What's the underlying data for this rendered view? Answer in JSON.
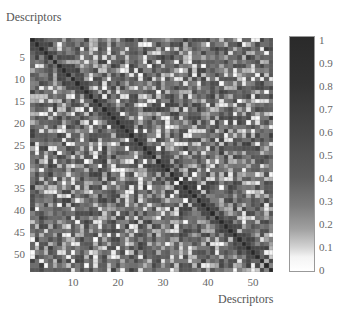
{
  "chart_data": {
    "type": "heatmap",
    "title": "Descriptors",
    "xlabel": "Descriptors",
    "ylabel": "Descriptors",
    "rows": 54,
    "cols": 54,
    "x_ticks": [
      10,
      20,
      30,
      40,
      50
    ],
    "y_ticks": [
      5,
      10,
      15,
      20,
      25,
      30,
      35,
      40,
      45,
      50
    ],
    "colorbar": {
      "ticks": [
        "0",
        "0.1",
        "0.2",
        "0.3",
        "0.4",
        "0.5",
        "0.6",
        "0.7",
        "0.8",
        "0.9",
        "1"
      ],
      "range": [
        0,
        1
      ],
      "colormap": "gray_r (white = 0, black = 1)"
    },
    "diagonal_value": 1,
    "symmetric": true,
    "value_distribution": "mostly 0.5–0.9 (dark gray) with scattered low values 0–0.2 (white/light squares)",
    "seed": 1337
  },
  "labels": {
    "title": "Descriptors",
    "xlabel": "Descriptors",
    "x_ticks": [
      "10",
      "20",
      "30",
      "40",
      "50"
    ],
    "y_ticks": [
      "5",
      "10",
      "15",
      "20",
      "25",
      "30",
      "35",
      "40",
      "45",
      "50"
    ],
    "cbar_ticks": [
      "1",
      "0.9",
      "0.8",
      "0.7",
      "0.6",
      "0.5",
      "0.4",
      "0.3",
      "0.2",
      "0.1",
      "0"
    ]
  }
}
